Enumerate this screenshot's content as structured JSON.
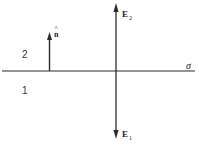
{
  "diagram": {
    "type": "boundary-field-diagram",
    "colors": {
      "line": "#2a2a2a",
      "background": "#ffffff"
    },
    "interface": {
      "label": "σ"
    },
    "regions": [
      {
        "id": "region-2",
        "label": "2",
        "position": "above interface"
      },
      {
        "id": "region-1",
        "label": "1",
        "position": "below interface"
      }
    ],
    "normal_vector": {
      "label": "n",
      "accent": "^",
      "direction": "up"
    },
    "fields": [
      {
        "id": "E2",
        "base": "E",
        "sub": "2",
        "direction": "up"
      },
      {
        "id": "E1",
        "base": "E",
        "sub": "1",
        "direction": "down"
      }
    ]
  }
}
